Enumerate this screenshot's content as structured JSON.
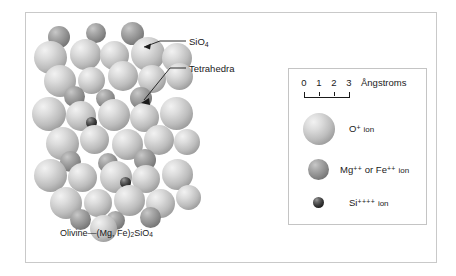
{
  "figure": {
    "title_caption": "Olivine—(Mg, Fe)₂SiO₄",
    "caption_parts": {
      "name": "Olivine—(Mg, Fe)",
      "sub1": "2",
      "mid": "SiO",
      "sub2": "4"
    },
    "callouts": [
      {
        "name": "sio4",
        "text": "SiO",
        "sub": "4",
        "target_x": 140,
        "target_y": 47
      },
      {
        "name": "tetrahedra",
        "text": "Tetrahedra",
        "sub": "",
        "target_x": 140,
        "target_y": 103
      }
    ]
  },
  "legend": {
    "scale": {
      "ticks": [
        "0",
        "1",
        "2",
        "3"
      ],
      "unit": "Ångstroms",
      "range_min": 0,
      "range_max": 3
    },
    "entries": [
      {
        "name": "oxygen",
        "symbol": "O",
        "charge": "+",
        "suffix": "ion",
        "color": "#c6c6c6",
        "size_px": 32
      },
      {
        "name": "magnesium-iron",
        "symbol": "Mg",
        "charge": "++",
        "conjunction": "or",
        "symbol2": "Fe",
        "charge2": "++",
        "suffix": "ion",
        "color": "#8f8f8f",
        "size_px": 21
      },
      {
        "name": "silicon",
        "symbol": "Si",
        "charge": "++++",
        "suffix": "ion",
        "color": "#2a2a2a",
        "size_px": 11
      }
    ]
  },
  "colors": {
    "frame_border": "#c9c9c9",
    "legend_border": "#c4c4c4",
    "text": "#1a1a1a",
    "background": "#ffffff"
  },
  "structure": {
    "description": "Ball-and-stick close-packed olivine crystal lattice",
    "atoms": [
      {
        "t": "mg",
        "x": 22,
        "y": 13,
        "d": 22
      },
      {
        "t": "mg",
        "x": 60,
        "y": 10,
        "d": 20
      },
      {
        "t": "mg",
        "x": 95,
        "y": 9,
        "d": 23
      },
      {
        "t": "ox",
        "x": 8,
        "y": 28,
        "d": 33
      },
      {
        "t": "ox",
        "x": 44,
        "y": 26,
        "d": 31
      },
      {
        "t": "ox",
        "x": 74,
        "y": 28,
        "d": 29
      },
      {
        "t": "ox",
        "x": 105,
        "y": 24,
        "d": 34
      },
      {
        "t": "ox",
        "x": 136,
        "y": 30,
        "d": 30
      },
      {
        "t": "si",
        "x": 86,
        "y": 33,
        "d": 11
      },
      {
        "t": "ox",
        "x": 18,
        "y": 52,
        "d": 32
      },
      {
        "t": "ox",
        "x": 52,
        "y": 54,
        "d": 27
      },
      {
        "t": "ox",
        "x": 82,
        "y": 48,
        "d": 30
      },
      {
        "t": "ox",
        "x": 112,
        "y": 52,
        "d": 28
      },
      {
        "t": "ox",
        "x": 140,
        "y": 50,
        "d": 27
      },
      {
        "t": "mg",
        "x": 38,
        "y": 73,
        "d": 21
      },
      {
        "t": "mg",
        "x": 70,
        "y": 76,
        "d": 19
      },
      {
        "t": "mg",
        "x": 104,
        "y": 74,
        "d": 22
      },
      {
        "t": "ox",
        "x": 6,
        "y": 84,
        "d": 34
      },
      {
        "t": "ox",
        "x": 40,
        "y": 88,
        "d": 30
      },
      {
        "t": "ox",
        "x": 72,
        "y": 86,
        "d": 32
      },
      {
        "t": "ox",
        "x": 104,
        "y": 90,
        "d": 29
      },
      {
        "t": "ox",
        "x": 134,
        "y": 84,
        "d": 33
      },
      {
        "t": "si",
        "x": 60,
        "y": 104,
        "d": 11
      },
      {
        "t": "ox",
        "x": 20,
        "y": 114,
        "d": 33
      },
      {
        "t": "ox",
        "x": 54,
        "y": 112,
        "d": 29
      },
      {
        "t": "ox",
        "x": 86,
        "y": 116,
        "d": 31
      },
      {
        "t": "ox",
        "x": 118,
        "y": 112,
        "d": 30
      },
      {
        "t": "ox",
        "x": 148,
        "y": 116,
        "d": 26
      },
      {
        "t": "mg",
        "x": 34,
        "y": 138,
        "d": 21
      },
      {
        "t": "mg",
        "x": 72,
        "y": 140,
        "d": 20
      },
      {
        "t": "mg",
        "x": 108,
        "y": 136,
        "d": 22
      },
      {
        "t": "ox",
        "x": 8,
        "y": 146,
        "d": 33
      },
      {
        "t": "ox",
        "x": 42,
        "y": 150,
        "d": 29
      },
      {
        "t": "ox",
        "x": 74,
        "y": 148,
        "d": 32
      },
      {
        "t": "ox",
        "x": 106,
        "y": 152,
        "d": 28
      },
      {
        "t": "ox",
        "x": 136,
        "y": 146,
        "d": 31
      },
      {
        "t": "si",
        "x": 94,
        "y": 164,
        "d": 11
      },
      {
        "t": "ox",
        "x": 24,
        "y": 174,
        "d": 32
      },
      {
        "t": "ox",
        "x": 58,
        "y": 176,
        "d": 28
      },
      {
        "t": "ox",
        "x": 88,
        "y": 172,
        "d": 31
      },
      {
        "t": "ox",
        "x": 120,
        "y": 176,
        "d": 29
      },
      {
        "t": "ox",
        "x": 150,
        "y": 172,
        "d": 25
      },
      {
        "t": "mg",
        "x": 44,
        "y": 196,
        "d": 21
      },
      {
        "t": "mg",
        "x": 80,
        "y": 198,
        "d": 19
      },
      {
        "t": "mg",
        "x": 114,
        "y": 194,
        "d": 21
      },
      {
        "t": "ox",
        "x": 64,
        "y": 202,
        "d": 27
      }
    ]
  }
}
